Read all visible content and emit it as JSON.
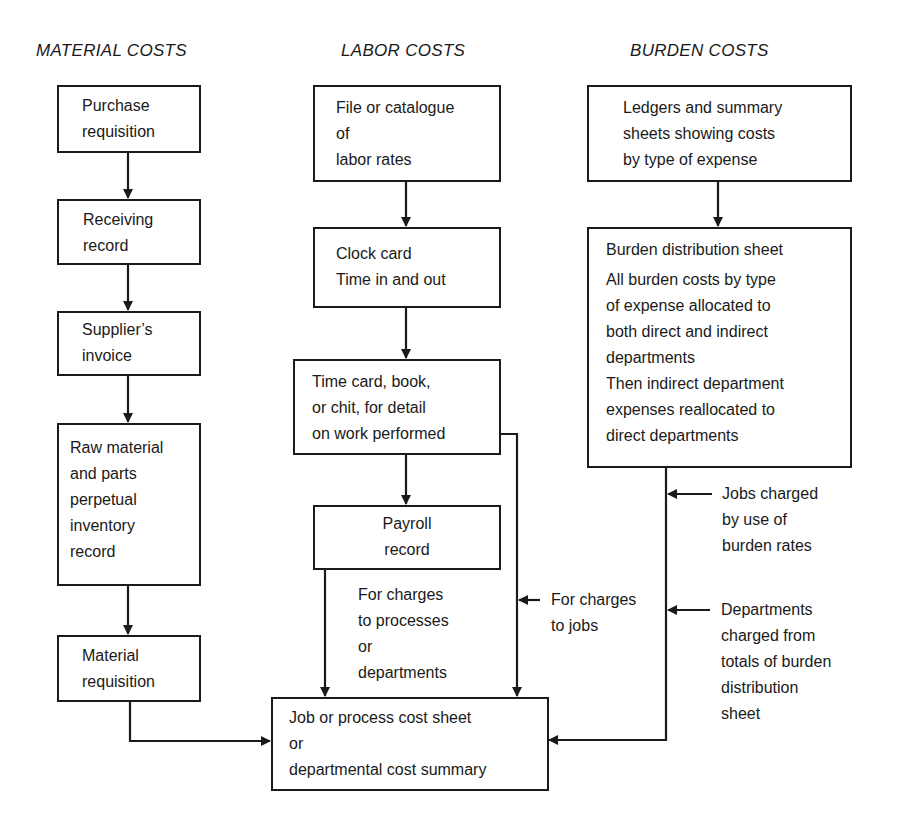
{
  "columns": {
    "material": {
      "heading": "MATERIAL COSTS",
      "boxes": [
        {
          "lines": [
            "Purchase",
            "requisition"
          ]
        },
        {
          "lines": [
            "Receiving",
            "record"
          ]
        },
        {
          "lines": [
            "Supplier’s",
            "invoice"
          ]
        },
        {
          "lines": [
            "Raw material",
            "and parts",
            "perpetual",
            "inventory",
            "record"
          ]
        },
        {
          "lines": [
            "Material",
            "requisition"
          ]
        }
      ]
    },
    "labor": {
      "heading": "LABOR COSTS",
      "boxes": [
        {
          "lines": [
            "File or catalogue",
            "of",
            "labor rates"
          ]
        },
        {
          "lines": [
            "Clock card",
            "Time in and out"
          ]
        },
        {
          "lines": [
            "Time card, book,",
            "or chit, for detail",
            "on work performed"
          ]
        },
        {
          "lines": [
            "Payroll",
            "record"
          ]
        }
      ]
    },
    "burden": {
      "heading": "BURDEN COSTS",
      "boxes": [
        {
          "lines": [
            "Ledgers and summary",
            "sheets showing costs",
            "by type of expense"
          ]
        },
        {
          "title": "Burden distribution sheet",
          "lines": [
            "All burden costs by type",
            "of expense allocated to",
            "both direct and indirect",
            "departments",
            "Then indirect department",
            "expenses reallocated to",
            "direct departments"
          ]
        }
      ]
    }
  },
  "final_box": {
    "lines": [
      "Job or process cost sheet",
      "or",
      "departmental cost summary"
    ]
  },
  "notes": {
    "processes": [
      "For charges",
      "to processes",
      "or",
      "departments"
    ],
    "jobs": [
      "For charges",
      "to jobs"
    ],
    "burden_jobs": [
      "Jobs charged",
      "by use of",
      "burden rates"
    ],
    "burden_departments": [
      "Departments",
      "charged from",
      "totals of burden",
      "distribution",
      "sheet"
    ]
  },
  "colors": {
    "line": "#1a1a1a",
    "background": "#ffffff"
  }
}
